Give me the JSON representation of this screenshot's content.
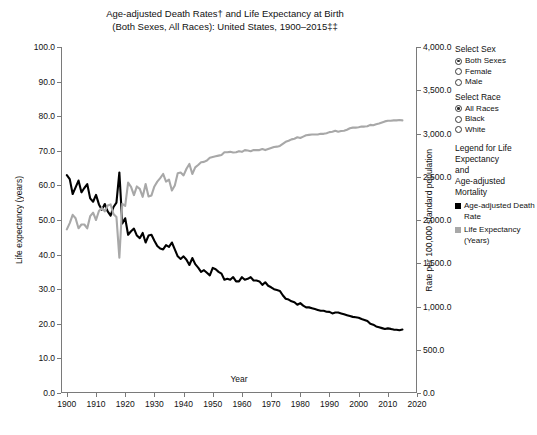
{
  "chart_data": {
    "type": "line",
    "title": "Age-adjusted Death Rates† and Life Expectancy at Birth (Both Sexes, All Races): United States, 1900–2015‡‡",
    "title_line1": "Age-adjusted Death Rates† and Life Expectancy at Birth",
    "title_line2": "(Both Sexes, All Races): United States, 1900–2015‡‡",
    "xlabel": "Year",
    "ylabel": "Life expectancy (years)",
    "ylabel_right": "Rate per 100,000 standard population",
    "xlim": [
      1898,
      2020
    ],
    "ylim": [
      0,
      100
    ],
    "ylim_right": [
      0,
      4000
    ],
    "xticks": [
      1900,
      1910,
      1920,
      1930,
      1940,
      1950,
      1960,
      1970,
      1980,
      1990,
      2000,
      2010,
      2020
    ],
    "yticks": [
      "0.0",
      "10.0",
      "20.0",
      "30.0",
      "40.0",
      "50.0",
      "60.0",
      "70.0",
      "80.0",
      "90.0",
      "100.0"
    ],
    "yticks_right": [
      "0.0",
      "500.0",
      "1,000.0",
      "1,500.0",
      "2,000.0",
      "2,500.0",
      "3,000.0",
      "3,500.0",
      "4,000.0"
    ],
    "grid": false,
    "legend_position": "right",
    "series": [
      {
        "name": "Age-adjusted Death Rate",
        "color": "#000000",
        "axis": "right",
        "x": [
          1900,
          1901,
          1902,
          1903,
          1904,
          1905,
          1906,
          1907,
          1908,
          1909,
          1910,
          1911,
          1912,
          1913,
          1914,
          1915,
          1916,
          1917,
          1918,
          1919,
          1920,
          1921,
          1922,
          1923,
          1924,
          1925,
          1926,
          1927,
          1928,
          1929,
          1930,
          1931,
          1932,
          1933,
          1934,
          1935,
          1936,
          1937,
          1938,
          1939,
          1940,
          1941,
          1942,
          1943,
          1944,
          1945,
          1946,
          1947,
          1948,
          1949,
          1950,
          1951,
          1952,
          1953,
          1954,
          1955,
          1956,
          1957,
          1958,
          1959,
          1960,
          1961,
          1962,
          1963,
          1964,
          1965,
          1966,
          1967,
          1968,
          1969,
          1970,
          1971,
          1972,
          1973,
          1974,
          1975,
          1976,
          1977,
          1978,
          1979,
          1980,
          1981,
          1982,
          1983,
          1984,
          1985,
          1986,
          1987,
          1988,
          1989,
          1990,
          1991,
          1992,
          1993,
          1994,
          1995,
          1996,
          1997,
          1998,
          1999,
          2000,
          2001,
          2002,
          2003,
          2004,
          2005,
          2006,
          2007,
          2008,
          2009,
          2010,
          2011,
          2012,
          2013,
          2014,
          2015
        ],
        "y": [
          2518,
          2473,
          2301,
          2378,
          2456,
          2320,
          2370,
          2415,
          2250,
          2211,
          2290,
          2180,
          2120,
          2185,
          2100,
          2050,
          2150,
          2200,
          2550,
          1960,
          2020,
          1830,
          1870,
          1900,
          1820,
          1790,
          1850,
          1740,
          1820,
          1830,
          1760,
          1700,
          1670,
          1660,
          1710,
          1690,
          1740,
          1660,
          1580,
          1550,
          1580,
          1540,
          1480,
          1560,
          1490,
          1450,
          1400,
          1420,
          1390,
          1360,
          1446,
          1430,
          1400,
          1380,
          1310,
          1320,
          1310,
          1340,
          1290,
          1290,
          1339,
          1310,
          1320,
          1340,
          1300,
          1300,
          1290,
          1250,
          1280,
          1240,
          1222,
          1200,
          1190,
          1180,
          1130,
          1090,
          1080,
          1060,
          1050,
          1020,
          1039,
          1010,
          990,
          990,
          980,
          970,
          960,
          950,
          950,
          940,
          938,
          920,
          930,
          930,
          920,
          910,
          900,
          890,
          880,
          875,
          869,
          855,
          845,
          832,
          800,
          790,
          770,
          760,
          750,
          740,
          747,
          741,
          733,
          732,
          725,
          733
        ]
      },
      {
        "name": "Life Expectancy (Years)",
        "color": "#a8a8a8",
        "axis": "left",
        "x": [
          1900,
          1901,
          1902,
          1903,
          1904,
          1905,
          1906,
          1907,
          1908,
          1909,
          1910,
          1911,
          1912,
          1913,
          1914,
          1915,
          1916,
          1917,
          1918,
          1919,
          1920,
          1921,
          1922,
          1923,
          1924,
          1925,
          1926,
          1927,
          1928,
          1929,
          1930,
          1931,
          1932,
          1933,
          1934,
          1935,
          1936,
          1937,
          1938,
          1939,
          1940,
          1941,
          1942,
          1943,
          1944,
          1945,
          1946,
          1947,
          1948,
          1949,
          1950,
          1951,
          1952,
          1953,
          1954,
          1955,
          1956,
          1957,
          1958,
          1959,
          1960,
          1961,
          1962,
          1963,
          1964,
          1965,
          1966,
          1967,
          1968,
          1969,
          1970,
          1971,
          1972,
          1973,
          1974,
          1975,
          1976,
          1977,
          1978,
          1979,
          1980,
          1981,
          1982,
          1983,
          1984,
          1985,
          1986,
          1987,
          1988,
          1989,
          1990,
          1991,
          1992,
          1993,
          1994,
          1995,
          1996,
          1997,
          1998,
          1999,
          2000,
          2001,
          2002,
          2003,
          2004,
          2005,
          2006,
          2007,
          2008,
          2009,
          2010,
          2011,
          2012,
          2013,
          2014,
          2015
        ],
        "y": [
          47.3,
          49.1,
          51.5,
          50.5,
          47.6,
          48.7,
          48.7,
          47.6,
          51.1,
          52.1,
          50.0,
          52.6,
          53.5,
          52.5,
          54.2,
          54.5,
          51.7,
          50.9,
          39.1,
          54.7,
          54.1,
          60.8,
          59.6,
          57.2,
          59.7,
          59.0,
          56.7,
          60.4,
          56.8,
          57.1,
          59.7,
          61.1,
          62.1,
          63.3,
          61.1,
          61.7,
          58.5,
          60.0,
          63.5,
          63.7,
          62.9,
          64.8,
          66.2,
          63.3,
          65.2,
          65.9,
          66.7,
          66.8,
          67.2,
          68.0,
          68.2,
          68.4,
          68.6,
          68.8,
          69.6,
          69.6,
          69.7,
          69.5,
          69.6,
          69.9,
          69.7,
          70.2,
          70.1,
          69.9,
          70.2,
          70.2,
          70.2,
          70.5,
          70.2,
          70.5,
          70.8,
          71.1,
          71.2,
          71.4,
          72.0,
          72.6,
          72.9,
          73.3,
          73.5,
          73.9,
          73.7,
          74.1,
          74.5,
          74.6,
          74.7,
          74.7,
          74.7,
          74.9,
          74.9,
          75.1,
          75.4,
          75.5,
          75.8,
          75.5,
          75.7,
          75.8,
          76.1,
          76.5,
          76.7,
          76.7,
          76.8,
          77.0,
          77.0,
          77.1,
          77.5,
          77.4,
          77.7,
          77.9,
          78.2,
          78.5,
          78.7,
          78.7,
          78.8,
          78.8,
          78.9,
          78.8
        ]
      }
    ]
  },
  "panel": {
    "sex": {
      "heading": "Select Sex",
      "options": [
        {
          "label": "Both Sexes",
          "selected": true
        },
        {
          "label": "Female",
          "selected": false
        },
        {
          "label": "Male",
          "selected": false
        }
      ]
    },
    "race": {
      "heading": "Select Race",
      "options": [
        {
          "label": "All Races",
          "selected": true
        },
        {
          "label": "Black",
          "selected": false
        },
        {
          "label": "White",
          "selected": false
        }
      ]
    },
    "legend": {
      "heading_line1": "Legend for Life",
      "heading_line2": "Expectancy",
      "heading_line3": "and",
      "heading_line4": "Age-adjusted",
      "heading_line5": "Mortality",
      "items": [
        {
          "label": "Age-adjusted Death Rate",
          "color": "#000000"
        },
        {
          "label": "Life Expectancy (Years)",
          "color": "#a8a8a8"
        }
      ]
    }
  }
}
